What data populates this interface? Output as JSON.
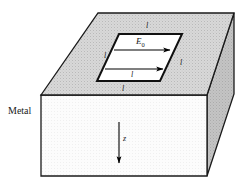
{
  "figure": {
    "material_label": "Metal",
    "field_label": "E",
    "field_subscript": "0",
    "axis_label": "z",
    "edge_labels": {
      "top": "l",
      "left": "l",
      "right": "l",
      "bottom_inside": "l",
      "bottom_outside": "l"
    },
    "colors": {
      "top_face": "#d6d6d6",
      "front_face": "#fbfbfb",
      "side_face": "#c2c2c2",
      "aperture_face": "#ffffff",
      "outline": "#1a1a1a",
      "arrow": "#000000",
      "text": "#1a1a1a",
      "background": "#ffffff"
    },
    "geometry": {
      "top_face_points": "98,13 234,13 207,95 41,95",
      "front_face_points": "41,95 207,95 207,176 41,176",
      "side_face_points": "207,95 234,13 234,94 207,176",
      "aperture_points": "119,34 182,34 160,81 97,81",
      "arrow_upper": {
        "x1": 114,
        "y1": 50,
        "x2": 172,
        "y2": 50
      },
      "arrow_lower": {
        "x1": 105,
        "y1": 69,
        "x2": 165,
        "y2": 69
      },
      "arrow_z": {
        "x1": 119,
        "y1": 122,
        "x2": 119,
        "y2": 166
      }
    },
    "label_positions": {
      "material": {
        "left": 8,
        "top": 106
      },
      "field": {
        "left": 136,
        "top": 37
      },
      "axis": {
        "left": 123,
        "top": 135
      },
      "edge_top": {
        "left": 146,
        "top": 22
      },
      "edge_left": {
        "left": 104,
        "top": 52
      },
      "edge_right": {
        "left": 180,
        "top": 59
      },
      "edge_bottom_inside": {
        "left": 131,
        "top": 71
      },
      "edge_bottom_outside": {
        "left": 122,
        "top": 85
      }
    }
  }
}
